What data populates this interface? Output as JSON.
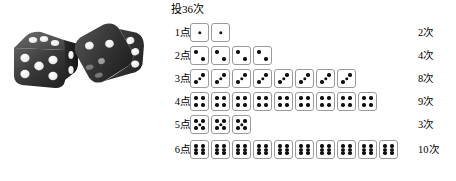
{
  "photo": {
    "alt_name": "two-black-dice-photo",
    "description": "Photograph of two black dice with white pips"
  },
  "chart": {
    "title": "投36次",
    "rows": [
      {
        "label": "1点",
        "face": 1,
        "count": 2,
        "count_label": "2次"
      },
      {
        "label": "2点",
        "face": 2,
        "count": 4,
        "count_label": "4次"
      },
      {
        "label": "3点",
        "face": 3,
        "count": 8,
        "count_label": "8次"
      },
      {
        "label": "4点",
        "face": 4,
        "count": 9,
        "count_label": "9次"
      },
      {
        "label": "5点",
        "face": 5,
        "count": 3,
        "count_label": "3次"
      },
      {
        "label": "6点",
        "face": 6,
        "count": 10,
        "count_label": "10次"
      }
    ]
  },
  "chart_data": {
    "type": "bar",
    "title": "投36次",
    "categories": [
      "1点",
      "2点",
      "3点",
      "4点",
      "5点",
      "6点"
    ],
    "values": [
      2,
      4,
      8,
      9,
      3,
      10
    ],
    "value_labels": [
      "2次",
      "4次",
      "8次",
      "9次",
      "3次",
      "10次"
    ],
    "xlabel": "",
    "ylabel": "",
    "ylim": [
      0,
      10
    ],
    "orientation": "horizontal",
    "note": "Pictograph tally: each unit is a die face icon matching its row number",
    "total": 36
  },
  "colors": {
    "die_border": "#9a9a9a",
    "die_face": "#ffffff",
    "pip": "#101010",
    "text": "#000000",
    "background": "#ffffff"
  }
}
